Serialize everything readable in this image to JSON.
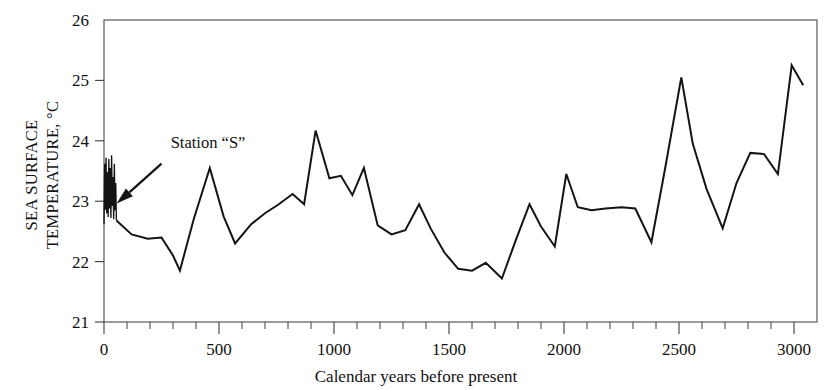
{
  "chart_data": {
    "type": "line",
    "title": "",
    "xlabel": "Calendar years before present",
    "ylabel_line1": "SEA SURFACE",
    "ylabel_line2": "TEMPERATURE, °C",
    "xlim": [
      0,
      3100
    ],
    "ylim": [
      21,
      26
    ],
    "xticks": [
      0,
      500,
      1000,
      1500,
      2000,
      2500,
      3000
    ],
    "xtick_labels": [
      "0",
      "500",
      "1000",
      "1500",
      "2000",
      "2500",
      "3000"
    ],
    "xtick_minor_step": 100,
    "yticks": [
      21,
      22,
      23,
      24,
      25,
      26
    ],
    "ytick_labels": [
      "21",
      "22",
      "23",
      "24",
      "25",
      "26"
    ],
    "grid": false,
    "legend": "none",
    "line_color": "#141414",
    "frame_color": "#4a4a4a",
    "annotations": [
      {
        "text": "Station “S”",
        "text_x": 290,
        "text_y": 23.88,
        "arrow_tip_x": 55,
        "arrow_tip_y": 22.96,
        "arrow_tail_x": 250,
        "arrow_tail_y": 23.72
      }
    ],
    "series": [
      {
        "name": "Station \"S\" instrumental record",
        "note": "dense high-frequency oscillation near 0 years BP",
        "x": [
          0,
          3,
          6,
          9,
          12,
          15,
          18,
          21,
          24,
          27,
          30,
          33,
          36,
          39,
          42,
          45,
          48,
          51,
          54
        ],
        "values": [
          22.62,
          23.62,
          22.86,
          23.72,
          22.8,
          23.48,
          22.74,
          23.7,
          22.88,
          23.55,
          22.72,
          23.76,
          22.92,
          23.4,
          22.7,
          23.62,
          22.85,
          23.3,
          22.68
        ]
      },
      {
        "name": "Sea surface temperature reconstruction",
        "x": [
          54,
          120,
          190,
          250,
          300,
          330,
          390,
          460,
          520,
          570,
          640,
          700,
          760,
          820,
          870,
          920,
          980,
          1030,
          1080,
          1130,
          1190,
          1250,
          1310,
          1370,
          1420,
          1480,
          1540,
          1600,
          1660,
          1730,
          1790,
          1850,
          1900,
          1960,
          2010,
          2060,
          2120,
          2180,
          2250,
          2310,
          2380,
          2440,
          2510,
          2560,
          2620,
          2690,
          2750,
          2810,
          2870,
          2930,
          2990,
          3040
        ],
        "values": [
          22.68,
          22.45,
          22.38,
          22.4,
          22.1,
          21.85,
          22.7,
          23.55,
          22.75,
          22.3,
          22.62,
          22.8,
          22.95,
          23.12,
          22.95,
          24.17,
          23.38,
          23.42,
          23.1,
          23.55,
          22.6,
          22.45,
          22.52,
          22.95,
          22.55,
          22.15,
          21.88,
          21.85,
          21.98,
          21.72,
          22.35,
          22.95,
          22.58,
          22.25,
          23.45,
          22.9,
          22.85,
          22.88,
          22.9,
          22.88,
          22.32,
          23.55,
          25.05,
          23.95,
          23.2,
          22.55,
          23.3,
          23.8,
          23.78,
          23.45,
          25.25,
          24.92
        ]
      }
    ]
  }
}
